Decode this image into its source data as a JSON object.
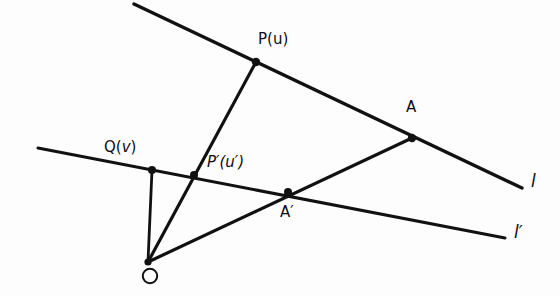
{
  "figure": {
    "background_color": "#fdfdfd",
    "ink_color": "#111111"
  },
  "labels": {
    "p": "P(u)",
    "q": "Q(v)",
    "p_prime": "P′(u′)",
    "a": "A",
    "a_prime": "A′",
    "o": "O",
    "line_l": "l",
    "line_l_prime": "l′"
  },
  "points": [
    {
      "name": "P",
      "label": "P(u)",
      "x": 256,
      "y": 62,
      "marker": "dot"
    },
    {
      "name": "Q",
      "label": "Q(v)",
      "x": 152,
      "y": 170,
      "marker": "dot"
    },
    {
      "name": "P_prime",
      "label": "P′(u′)",
      "x": 194,
      "y": 175,
      "marker": "dot"
    },
    {
      "name": "A",
      "label": "A",
      "x": 412,
      "y": 138,
      "marker": "dot"
    },
    {
      "name": "A_prime",
      "label": "A′",
      "x": 288,
      "y": 192,
      "marker": "dot"
    },
    {
      "name": "O",
      "label": "O",
      "x": 148,
      "y": 262,
      "marker": "ring"
    }
  ],
  "lines": [
    {
      "name": "line-l",
      "label": "l",
      "from": [
        134,
        4
      ],
      "to": [
        522,
        188
      ],
      "width": 3.4
    },
    {
      "name": "line-l-prime",
      "label": "l′",
      "from": [
        38,
        148
      ],
      "to": [
        505,
        238
      ],
      "width": 3.0
    },
    {
      "name": "ray-o-to-p",
      "label": "",
      "from": [
        148,
        262
      ],
      "to": [
        256,
        62
      ],
      "width": 3.2
    },
    {
      "name": "ray-o-to-a",
      "label": "",
      "from": [
        148,
        262
      ],
      "to": [
        412,
        138
      ],
      "width": 3.2
    },
    {
      "name": "segment-o-to-q",
      "label": "",
      "from": [
        148,
        262
      ],
      "to": [
        152,
        170
      ],
      "width": 2.8
    }
  ],
  "label_positions": {
    "p": {
      "x": 258,
      "y": 32
    },
    "q": {
      "x": 104,
      "y": 140
    },
    "p_prime": {
      "x": 207,
      "y": 155
    },
    "a": {
      "x": 406,
      "y": 100
    },
    "a_prime": {
      "x": 280,
      "y": 205
    },
    "o": {
      "x": 141,
      "y": 268
    },
    "line_l": {
      "x": 531,
      "y": 173
    },
    "line_l_prime": {
      "x": 514,
      "y": 224
    }
  }
}
